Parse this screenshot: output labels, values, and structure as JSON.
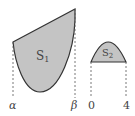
{
  "figure": {
    "region1": {
      "label": "S",
      "subscript": "1",
      "fill": "#c4c4c4",
      "stroke": "#333333"
    },
    "region2": {
      "label": "S",
      "subscript": "2",
      "fill": "#c4c4c4",
      "stroke": "#333333"
    },
    "axis_labels": {
      "alpha": "α",
      "beta": "β",
      "zero": "0",
      "four": "4"
    }
  }
}
